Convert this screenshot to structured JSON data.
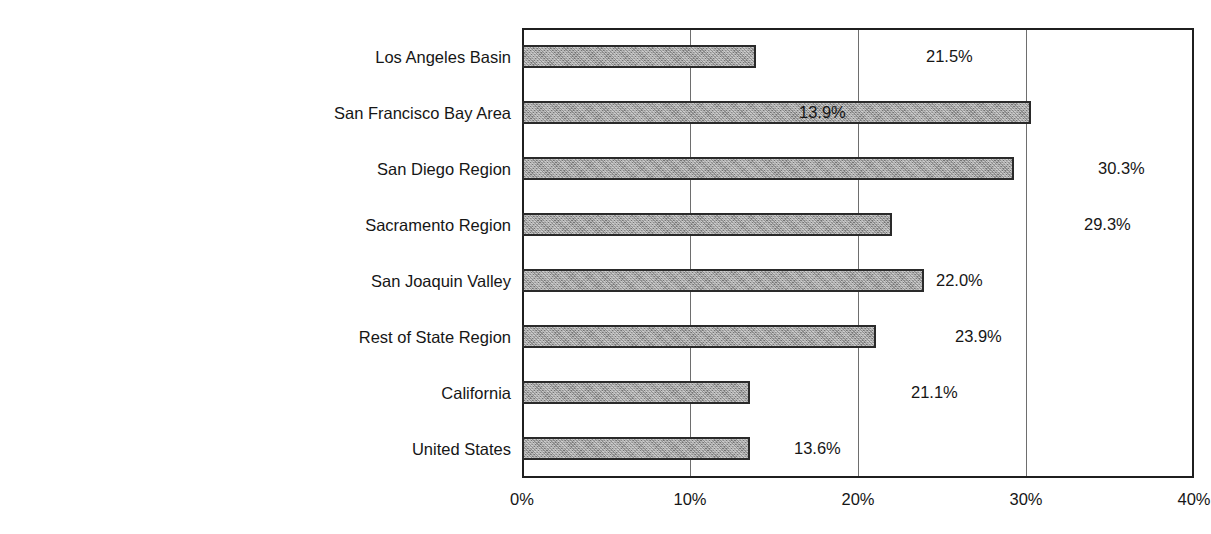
{
  "chart_data": {
    "type": "bar",
    "orientation": "horizontal",
    "title": "",
    "subtitle": "",
    "xlabel": "",
    "ylabel": "",
    "xlim": [
      0,
      40
    ],
    "ylim": null,
    "grid": true,
    "legend": null,
    "xticks": [
      "0%",
      "10%",
      "20%",
      "30%",
      "40%"
    ],
    "xtick_values": [
      0,
      10,
      20,
      30,
      40
    ],
    "categories": [
      "Los Angeles Basin",
      "San Francisco Bay Area",
      "San Diego Region",
      "Sacramento Region",
      "San Joaquin Valley",
      "Rest of State Region",
      "California",
      "United States"
    ],
    "values": [
      21.5,
      13.9,
      30.3,
      29.3,
      22.0,
      23.9,
      21.1,
      13.6
    ],
    "data_labels": [
      "21.5%",
      "13.9%",
      "30.3%",
      "29.3%",
      "22.0%",
      "23.9%",
      "21.1%",
      "13.6%"
    ],
    "bar_fill_color": "#9d9d9d",
    "bar_border_color": "#2a2a2a",
    "gridline_color": "#6e6e6e",
    "axis_color": "#1f1f1f",
    "text_color": "#161616",
    "background_color": "#ffffff"
  }
}
